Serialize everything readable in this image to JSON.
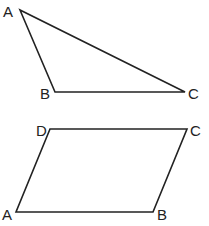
{
  "figures": [
    {
      "name": "triangle",
      "vertices": [
        {
          "label": "A",
          "x": 20,
          "y": 10,
          "lx": 3,
          "ly": 17
        },
        {
          "label": "B",
          "x": 55,
          "y": 92,
          "lx": 40,
          "ly": 99
        },
        {
          "label": "C",
          "x": 185,
          "y": 92,
          "lx": 188,
          "ly": 99
        }
      ]
    },
    {
      "name": "parallelogram",
      "vertices": [
        {
          "label": "D",
          "x": 50,
          "y": 129,
          "lx": 36,
          "ly": 136
        },
        {
          "label": "C",
          "x": 187,
          "y": 129,
          "lx": 190,
          "ly": 136
        },
        {
          "label": "B",
          "x": 153,
          "y": 212,
          "lx": 157,
          "ly": 220
        },
        {
          "label": "A",
          "x": 16,
          "y": 212,
          "lx": 2,
          "ly": 220
        }
      ]
    }
  ],
  "colors": {
    "stroke": "#222222",
    "background": "#ffffff"
  }
}
